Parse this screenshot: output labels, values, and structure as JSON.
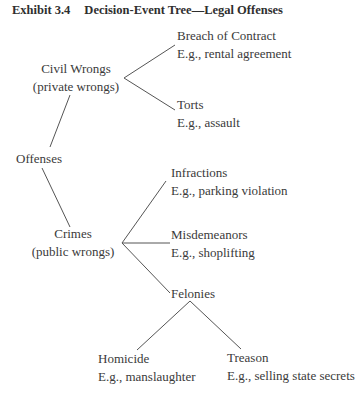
{
  "title": {
    "exhibit": "Exhibit 3.4",
    "text": "Decision-Event Tree—Legal Offenses"
  },
  "tree": {
    "root": "Offenses",
    "civil": {
      "label": "Civil Wrongs",
      "sub": "(private wrongs)",
      "children": [
        {
          "label": "Breach of Contract",
          "example": "E.g., rental agreement"
        },
        {
          "label": "Torts",
          "example": "E.g., assault"
        }
      ]
    },
    "crimes": {
      "label": "Crimes",
      "sub": "(public wrongs)",
      "children": [
        {
          "label": "Infractions",
          "example": "E.g., parking violation"
        },
        {
          "label": "Misdemeanors",
          "example": "E.g., shoplifting"
        },
        {
          "label": "Felonies",
          "example": ""
        }
      ]
    },
    "felonies": {
      "children": [
        {
          "label": "Homicide",
          "example": "E.g., manslaughter"
        },
        {
          "label": "Treason",
          "example": "E.g., selling state secrets"
        }
      ]
    }
  },
  "colors": {
    "line": "#555555",
    "text": "#3a3a3a"
  }
}
